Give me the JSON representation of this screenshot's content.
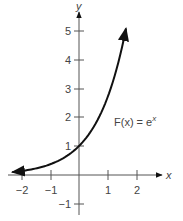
{
  "chart_data": {
    "type": "line",
    "title": "",
    "xlabel": "x",
    "ylabel": "y",
    "xlim": [
      -2.3,
      2.3
    ],
    "ylim": [
      -1.3,
      5.8
    ],
    "grid": false,
    "x_ticks": [
      -2,
      -1,
      1,
      2
    ],
    "x_tick_labels": [
      "−2",
      "−1",
      "1",
      "2"
    ],
    "y_ticks": [
      -1,
      1,
      2,
      3,
      4,
      5
    ],
    "y_tick_labels": [
      "−1",
      "1",
      "2",
      "3",
      "4",
      "5"
    ],
    "series": [
      {
        "name": "F(x) = e^x",
        "function": "exp(x)",
        "x": [
          -2.3,
          -2,
          -1.5,
          -1,
          -0.5,
          0,
          0.5,
          1,
          1.5,
          1.62
        ],
        "values": [
          0.1,
          0.14,
          0.22,
          0.37,
          0.61,
          1.0,
          1.65,
          2.72,
          4.48,
          5.05
        ]
      }
    ],
    "annotations": [
      {
        "text": "F(x) = e",
        "superscript": "x",
        "x": 1.2,
        "y": 2.4
      }
    ],
    "legend": "none"
  },
  "labels": {
    "x_axis": "x",
    "y_axis": "y",
    "function_name": "F(x) = e",
    "function_exp": "x"
  },
  "ticks": {
    "x": [
      "−2",
      "−1",
      "1",
      "2"
    ],
    "y": [
      "5",
      "4",
      "3",
      "2",
      "1",
      "−1"
    ]
  }
}
